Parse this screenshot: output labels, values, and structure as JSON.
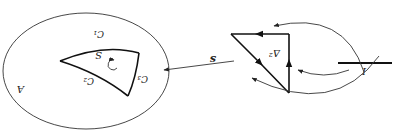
{
  "figure": {
    "orientation": "rotated 180 degrees",
    "labels": {
      "region": "A",
      "surface": "S",
      "edge1": "C₁",
      "edge2": "C₂",
      "edge3": "C₃",
      "simplex": "Δ²",
      "map": "s",
      "interval": "I"
    },
    "colors": {
      "stroke": "#111111",
      "background": "#ffffff"
    }
  }
}
